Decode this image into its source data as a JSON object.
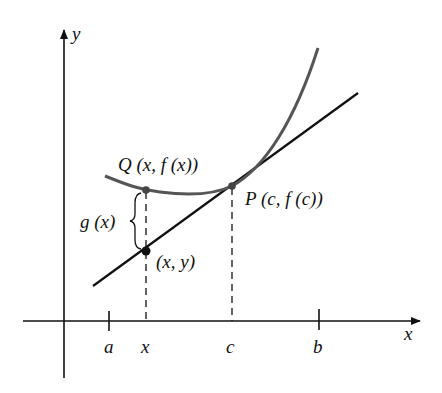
{
  "figure": {
    "axes": {
      "x_label": "x",
      "y_label": "y"
    },
    "ticks": [
      {
        "id": "a",
        "label": "a",
        "px": 109
      },
      {
        "id": "x",
        "label": "x",
        "px": 146
      },
      {
        "id": "c",
        "label": "c",
        "px": 232
      },
      {
        "id": "b",
        "label": "b",
        "px": 319
      }
    ],
    "points": {
      "Q": {
        "label": "Q (x, f (x))"
      },
      "P": {
        "label": "P (c, f (c))"
      },
      "L": {
        "label": "(x, y)"
      }
    },
    "brace_label": "g (x)",
    "colors": {
      "curve": "#555555",
      "line": "#111111",
      "axes": "#111111"
    }
  }
}
